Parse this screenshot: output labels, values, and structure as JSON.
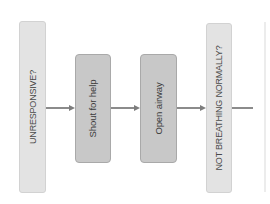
{
  "diagram": {
    "type": "flowchart",
    "orientation": "left-to-right, labels rotated vertical",
    "nodes": [
      {
        "id": "unresponsive",
        "label": "UNRESPONSIVE?",
        "kind": "question"
      },
      {
        "id": "shout",
        "label": "Shout for help",
        "kind": "action"
      },
      {
        "id": "airway",
        "label": "Open airway",
        "kind": "action"
      },
      {
        "id": "not-breathing",
        "label": "NOT BREATHING NORMALLY?",
        "kind": "question"
      }
    ],
    "edges": [
      {
        "from": "unresponsive",
        "to": "shout"
      },
      {
        "from": "shout",
        "to": "airway"
      },
      {
        "from": "airway",
        "to": "not-breathing"
      },
      {
        "from": "not-breathing",
        "to": "(continues off-image)"
      }
    ],
    "colors": {
      "question_fill": "#e3e3e3",
      "action_fill": "#c8c8c8",
      "action_border": "#a9a9a9",
      "connector": "#8b8b8b",
      "text": "#4a4a4a"
    }
  }
}
